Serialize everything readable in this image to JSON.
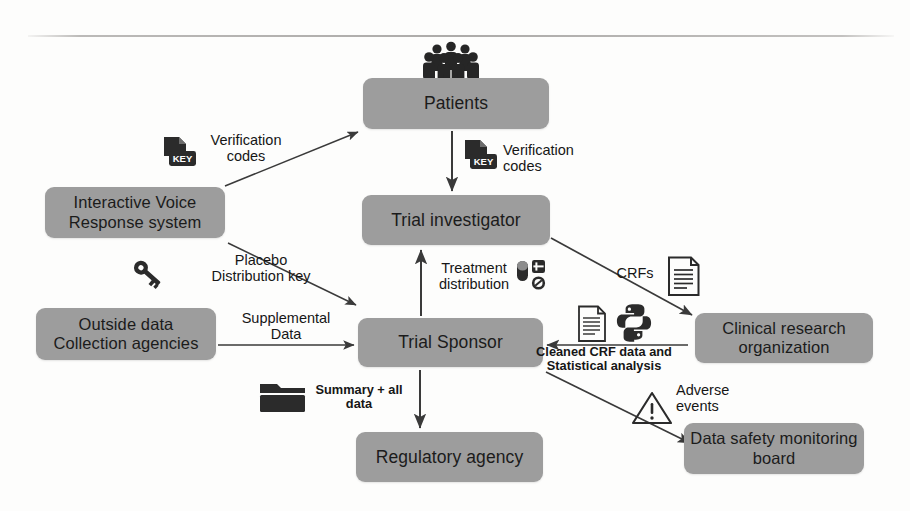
{
  "diagram": {
    "nodes": [
      {
        "id": "patients",
        "label": "Patients"
      },
      {
        "id": "investigator",
        "label": "Trial investigator"
      },
      {
        "id": "ivr",
        "label": "Interactive Voice\nResponse system"
      },
      {
        "id": "outside",
        "label": "Outside data\nCollection agencies"
      },
      {
        "id": "sponsor",
        "label": "Trial Sponsor"
      },
      {
        "id": "cro",
        "label": "Clinical research\norganization"
      },
      {
        "id": "regulatory",
        "label": "Regulatory agency"
      },
      {
        "id": "dsmb",
        "label": "Data safety\nmonitoring board"
      }
    ],
    "edges": [
      {
        "id": "ivr-patients",
        "label": "Verification\ncodes"
      },
      {
        "id": "patients-investigator",
        "label": "Verification\ncodes"
      },
      {
        "id": "ivr-sponsor",
        "label": "Placebo\nDistribution key"
      },
      {
        "id": "outside-sponsor",
        "label": "Supplemental\nData"
      },
      {
        "id": "sponsor-investigator",
        "label": "Treatment\ndistribution"
      },
      {
        "id": "investigator-cro",
        "label": "CRFs"
      },
      {
        "id": "cro-sponsor",
        "label": "Cleaned CRF data and\nStatistical analysis"
      },
      {
        "id": "sponsor-dsmb",
        "label": "Adverse\nevents"
      },
      {
        "id": "sponsor-regulatory",
        "label": "Summary + all\ndata"
      }
    ],
    "icons": [
      {
        "id": "crowd",
        "name": "people-crowd-icon"
      },
      {
        "id": "key-doc-left",
        "name": "key-document-icon"
      },
      {
        "id": "key-doc-mid",
        "name": "key-document-icon"
      },
      {
        "id": "key",
        "name": "key-icon"
      },
      {
        "id": "pills",
        "name": "pills-tablets-icon"
      },
      {
        "id": "crf-doc",
        "name": "document-lines-icon"
      },
      {
        "id": "stats-doc",
        "name": "document-lines-icon"
      },
      {
        "id": "python",
        "name": "python-logo-icon"
      },
      {
        "id": "warning",
        "name": "warning-triangle-icon"
      },
      {
        "id": "folder",
        "name": "folder-icon"
      }
    ],
    "colors": {
      "node_fill": "#9d9d9d",
      "text": "#1b1b1b",
      "arrow": "#3a3a3a",
      "background": "#fdfdfc",
      "icon_dark": "#2b2b2b"
    },
    "icon_labels": {
      "key_doc_text": "KEY"
    }
  }
}
